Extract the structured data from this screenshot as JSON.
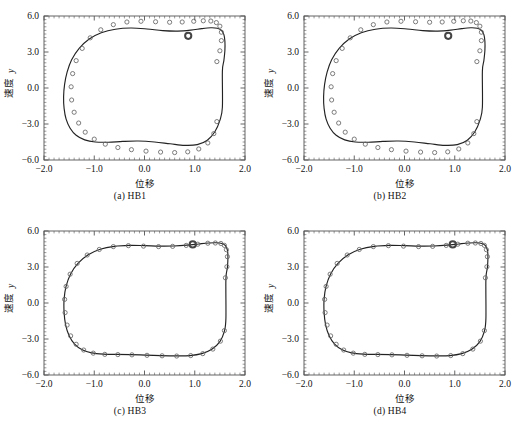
{
  "figure": {
    "title": "",
    "panel_count": 4,
    "layout": "2x2"
  },
  "axes": {
    "xlabel": "位移",
    "ylabel_cjk": "速度",
    "ylabel_sym": "y",
    "xticks": [
      "-2.0",
      "-1.0",
      "0.0",
      "1.0",
      "2.0"
    ],
    "yticks": [
      "6.0",
      "3.0",
      "0.0",
      "-3.0",
      "-6.0"
    ],
    "xlim": [
      -2.0,
      2.0
    ],
    "ylim": [
      -6.0,
      6.0
    ]
  },
  "colors": {
    "frame": "#555555",
    "curve": "#222222",
    "marker_stroke": "#666666",
    "highlight": "#444444",
    "text": "#111111"
  },
  "panels": [
    {
      "caption": "(a) HB1",
      "key": "HB1"
    },
    {
      "caption": "(b) HB2",
      "key": "HB2"
    },
    {
      "caption": "(c) HB3",
      "key": "HB3"
    },
    {
      "caption": "(d) HB4",
      "key": "HB4"
    }
  ],
  "chart_data": [
    {
      "type": "line",
      "title": "(a) HB1",
      "xlabel": "位移",
      "ylabel": "速度 y",
      "xlim": [
        -2.0,
        2.0
      ],
      "ylim": [
        -6.0,
        6.0
      ],
      "grid": false,
      "legend": "none",
      "series": [
        {
          "name": "harmonic-balance-curve",
          "style": "solid-line",
          "x": [
            1.55,
            1.58,
            1.6,
            1.6,
            1.58,
            1.53,
            1.45,
            1.32,
            1.14,
            0.92,
            0.66,
            0.36,
            0.05,
            -0.27,
            -0.58,
            -0.86,
            -1.1,
            -1.3,
            -1.45,
            -1.54,
            -1.59,
            -1.61,
            -1.6,
            -1.56,
            -1.48,
            -1.36,
            -1.19,
            -0.98,
            -0.72,
            -0.43,
            -0.12,
            0.2,
            0.51,
            0.8,
            1.05,
            1.25,
            1.4,
            1.5,
            1.55
          ],
          "y": [
            1.4,
            2.3,
            3.15,
            3.9,
            4.45,
            4.8,
            4.98,
            5.02,
            4.95,
            4.82,
            4.74,
            4.78,
            4.92,
            5.0,
            4.9,
            4.6,
            4.08,
            3.3,
            2.35,
            1.32,
            0.3,
            -0.72,
            -1.7,
            -2.6,
            -3.35,
            -3.94,
            -4.32,
            -4.5,
            -4.52,
            -4.45,
            -4.42,
            -4.5,
            -4.65,
            -4.78,
            -4.72,
            -4.35,
            -3.65,
            -2.7,
            -1.6
          ]
        },
        {
          "name": "numerical-markers",
          "style": "open-circles",
          "x": [
            1.44,
            1.5,
            1.53,
            1.53,
            1.5,
            1.43,
            1.32,
            1.17,
            0.98,
            0.75,
            0.5,
            0.22,
            -0.07,
            -0.35,
            -0.62,
            -0.87,
            -1.08,
            -1.24,
            -1.36,
            -1.43,
            -1.46,
            -1.45,
            -1.4,
            -1.31,
            -1.18,
            -1.0,
            -0.78,
            -0.53,
            -0.26,
            0.03,
            0.32,
            0.6,
            0.86,
            1.08,
            1.26,
            1.38,
            1.44
          ],
          "y": [
            2.2,
            3.1,
            3.95,
            4.65,
            5.15,
            5.45,
            5.58,
            5.6,
            5.56,
            5.5,
            5.48,
            5.52,
            5.56,
            5.5,
            5.28,
            4.85,
            4.18,
            3.3,
            2.28,
            1.2,
            0.1,
            -1.0,
            -2.02,
            -2.92,
            -3.68,
            -4.26,
            -4.68,
            -4.96,
            -5.14,
            -5.26,
            -5.34,
            -5.38,
            -5.32,
            -5.08,
            -4.58,
            -3.8,
            -2.8
          ]
        }
      ],
      "highlight_point": {
        "x": 0.87,
        "y": 4.35,
        "style": "bold-open-circle"
      }
    },
    {
      "type": "line",
      "title": "(b) HB2",
      "xlabel": "位移",
      "ylabel": "速度 y",
      "xlim": [
        -2.0,
        2.0
      ],
      "ylim": [
        -6.0,
        6.0
      ],
      "grid": false,
      "legend": "none",
      "series": [
        {
          "name": "harmonic-balance-curve",
          "style": "solid-line",
          "x": [
            1.55,
            1.58,
            1.6,
            1.6,
            1.58,
            1.53,
            1.45,
            1.32,
            1.14,
            0.92,
            0.66,
            0.36,
            0.05,
            -0.27,
            -0.58,
            -0.86,
            -1.1,
            -1.3,
            -1.45,
            -1.54,
            -1.59,
            -1.61,
            -1.6,
            -1.56,
            -1.48,
            -1.36,
            -1.19,
            -0.98,
            -0.72,
            -0.43,
            -0.12,
            0.2,
            0.51,
            0.8,
            1.05,
            1.25,
            1.4,
            1.5,
            1.55
          ],
          "y": [
            1.4,
            2.3,
            3.15,
            3.9,
            4.45,
            4.8,
            4.98,
            5.02,
            4.95,
            4.82,
            4.74,
            4.78,
            4.92,
            5.0,
            4.9,
            4.6,
            4.08,
            3.3,
            2.35,
            1.32,
            0.3,
            -0.72,
            -1.7,
            -2.6,
            -3.35,
            -3.94,
            -4.32,
            -4.5,
            -4.52,
            -4.45,
            -4.42,
            -4.5,
            -4.65,
            -4.78,
            -4.72,
            -4.35,
            -3.65,
            -2.7,
            -1.6
          ]
        },
        {
          "name": "numerical-markers",
          "style": "open-circles",
          "x": [
            1.44,
            1.5,
            1.53,
            1.53,
            1.5,
            1.43,
            1.32,
            1.17,
            0.98,
            0.75,
            0.5,
            0.22,
            -0.07,
            -0.35,
            -0.62,
            -0.87,
            -1.08,
            -1.24,
            -1.36,
            -1.43,
            -1.46,
            -1.45,
            -1.4,
            -1.31,
            -1.18,
            -1.0,
            -0.78,
            -0.53,
            -0.26,
            0.03,
            0.32,
            0.6,
            0.86,
            1.08,
            1.26,
            1.38,
            1.44
          ],
          "y": [
            2.2,
            3.1,
            3.95,
            4.65,
            5.15,
            5.45,
            5.58,
            5.6,
            5.56,
            5.5,
            5.48,
            5.52,
            5.56,
            5.5,
            5.28,
            4.85,
            4.18,
            3.3,
            2.28,
            1.2,
            0.1,
            -1.0,
            -2.02,
            -2.92,
            -3.68,
            -4.26,
            -4.68,
            -4.96,
            -5.14,
            -5.26,
            -5.34,
            -5.38,
            -5.32,
            -5.08,
            -4.58,
            -3.8,
            -2.8
          ]
        }
      ],
      "highlight_point": {
        "x": 0.87,
        "y": 4.35,
        "style": "bold-open-circle"
      }
    },
    {
      "type": "line",
      "title": "(c) HB3",
      "xlabel": "位移",
      "ylabel": "速度 y",
      "xlim": [
        -2.0,
        2.0
      ],
      "ylim": [
        -6.0,
        6.0
      ],
      "grid": false,
      "legend": "none",
      "series": [
        {
          "name": "harmonic-balance-curve",
          "style": "solid-line",
          "x": [
            1.62,
            1.65,
            1.66,
            1.65,
            1.61,
            1.54,
            1.43,
            1.28,
            1.08,
            0.85,
            0.58,
            0.3,
            0.0,
            -0.3,
            -0.6,
            -0.88,
            -1.12,
            -1.32,
            -1.47,
            -1.56,
            -1.6,
            -1.6,
            -1.57,
            -1.5,
            -1.39,
            -1.24,
            -1.05,
            -0.82,
            -0.56,
            -0.28,
            0.02,
            0.32,
            0.62,
            0.9,
            1.14,
            1.34,
            1.5,
            1.59,
            1.62
          ],
          "y": [
            2.0,
            2.95,
            3.8,
            4.4,
            4.78,
            4.96,
            5.02,
            5.0,
            4.92,
            4.82,
            4.75,
            4.74,
            4.78,
            4.8,
            4.72,
            4.48,
            4.02,
            3.32,
            2.42,
            1.4,
            0.32,
            -0.78,
            -1.82,
            -2.72,
            -3.42,
            -3.9,
            -4.16,
            -4.26,
            -4.28,
            -4.3,
            -4.34,
            -4.38,
            -4.4,
            -4.38,
            -4.22,
            -3.86,
            -3.22,
            -2.35,
            -1.3
          ]
        },
        {
          "name": "numerical-markers",
          "style": "open-circles",
          "x": [
            1.61,
            1.64,
            1.65,
            1.63,
            1.59,
            1.52,
            1.41,
            1.26,
            1.06,
            0.83,
            0.56,
            0.28,
            -0.02,
            -0.32,
            -0.62,
            -0.9,
            -1.14,
            -1.34,
            -1.48,
            -1.56,
            -1.59,
            -1.58,
            -1.54,
            -1.47,
            -1.36,
            -1.21,
            -1.02,
            -0.79,
            -0.53,
            -0.25,
            0.05,
            0.35,
            0.64,
            0.92,
            1.16,
            1.36,
            1.51,
            1.59
          ],
          "y": [
            2.1,
            3.02,
            3.86,
            4.44,
            4.8,
            4.96,
            5.0,
            4.98,
            4.9,
            4.8,
            4.72,
            4.7,
            4.74,
            4.78,
            4.7,
            4.46,
            4.0,
            3.3,
            2.4,
            1.38,
            0.3,
            -0.8,
            -1.84,
            -2.74,
            -3.44,
            -3.92,
            -4.18,
            -4.28,
            -4.3,
            -4.32,
            -4.36,
            -4.4,
            -4.42,
            -4.38,
            -4.22,
            -3.84,
            -3.18,
            -2.3
          ]
        }
      ],
      "highlight_point": {
        "x": 0.96,
        "y": 4.88,
        "style": "bold-open-circle"
      }
    },
    {
      "type": "line",
      "title": "(d) HB4",
      "xlabel": "位移",
      "ylabel": "速度 y",
      "xlim": [
        -2.0,
        2.0
      ],
      "ylim": [
        -6.0,
        6.0
      ],
      "grid": false,
      "legend": "none",
      "series": [
        {
          "name": "harmonic-balance-curve",
          "style": "solid-line",
          "x": [
            1.62,
            1.65,
            1.66,
            1.65,
            1.61,
            1.54,
            1.43,
            1.28,
            1.08,
            0.85,
            0.58,
            0.3,
            0.0,
            -0.3,
            -0.6,
            -0.88,
            -1.12,
            -1.32,
            -1.47,
            -1.56,
            -1.6,
            -1.6,
            -1.57,
            -1.5,
            -1.39,
            -1.24,
            -1.05,
            -0.82,
            -0.56,
            -0.28,
            0.02,
            0.32,
            0.62,
            0.9,
            1.14,
            1.34,
            1.5,
            1.59,
            1.62
          ],
          "y": [
            2.0,
            2.95,
            3.8,
            4.4,
            4.78,
            4.96,
            5.02,
            5.0,
            4.92,
            4.82,
            4.75,
            4.74,
            4.78,
            4.8,
            4.72,
            4.48,
            4.02,
            3.32,
            2.42,
            1.4,
            0.32,
            -0.78,
            -1.82,
            -2.72,
            -3.42,
            -3.9,
            -4.16,
            -4.26,
            -4.28,
            -4.3,
            -4.34,
            -4.38,
            -4.4,
            -4.38,
            -4.22,
            -3.86,
            -3.22,
            -2.35,
            -1.3
          ]
        },
        {
          "name": "numerical-markers",
          "style": "open-circles",
          "x": [
            1.61,
            1.64,
            1.65,
            1.63,
            1.59,
            1.52,
            1.41,
            1.26,
            1.06,
            0.83,
            0.56,
            0.28,
            -0.02,
            -0.32,
            -0.62,
            -0.9,
            -1.14,
            -1.34,
            -1.48,
            -1.56,
            -1.59,
            -1.58,
            -1.54,
            -1.47,
            -1.36,
            -1.21,
            -1.02,
            -0.79,
            -0.53,
            -0.25,
            0.05,
            0.35,
            0.64,
            0.92,
            1.16,
            1.36,
            1.51,
            1.59
          ],
          "y": [
            2.1,
            3.02,
            3.86,
            4.44,
            4.8,
            4.96,
            5.0,
            4.98,
            4.9,
            4.8,
            4.72,
            4.7,
            4.74,
            4.78,
            4.7,
            4.46,
            4.0,
            3.3,
            2.4,
            1.38,
            0.3,
            -0.8,
            -1.84,
            -2.74,
            -3.44,
            -3.92,
            -4.18,
            -4.28,
            -4.3,
            -4.32,
            -4.36,
            -4.4,
            -4.42,
            -4.38,
            -4.22,
            -3.84,
            -3.18,
            -2.3
          ]
        }
      ],
      "highlight_point": {
        "x": 0.96,
        "y": 4.88,
        "style": "bold-open-circle"
      }
    }
  ]
}
